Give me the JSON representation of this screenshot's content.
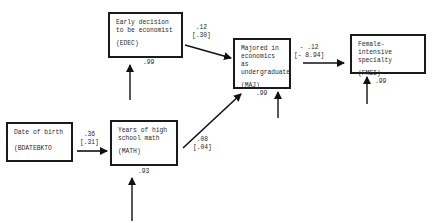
{
  "diagram": {
    "type": "path-diagram",
    "nodes": [
      {
        "id": "EDEC",
        "line1": "Early decision",
        "line2": "to be economist",
        "abbr": "(EDEC)",
        "residual": ".99"
      },
      {
        "id": "MAJ",
        "line1": "Majored in",
        "line2": "economics as",
        "line3": "undergraduate",
        "abbr": "(MAJ)",
        "residual": ".99"
      },
      {
        "id": "FMSI",
        "line1": "Female-intensive",
        "line2": "specialty",
        "abbr": "(FMSI)",
        "residual": ".99"
      },
      {
        "id": "BDATEBKTO",
        "line1": "Date of birth",
        "abbr": "(BDATEBKTO",
        "residual": ""
      },
      {
        "id": "MATH",
        "line1": "Years of high",
        "line2": "school math",
        "abbr": "(MATH)",
        "residual": ".93"
      }
    ],
    "edges": [
      {
        "from": "BDATEBKTO",
        "to": "MATH",
        "coef": ".36",
        "std": "[.31]"
      },
      {
        "from": "EDEC",
        "to": "MAJ",
        "coef": ".12",
        "std": "[.30]"
      },
      {
        "from": "MATH",
        "to": "MAJ",
        "coef": ".08",
        "std": "[.04]"
      },
      {
        "from": "MAJ",
        "to": "FMSI",
        "coef": "- .12",
        "std": "[- 8.94]"
      }
    ]
  }
}
